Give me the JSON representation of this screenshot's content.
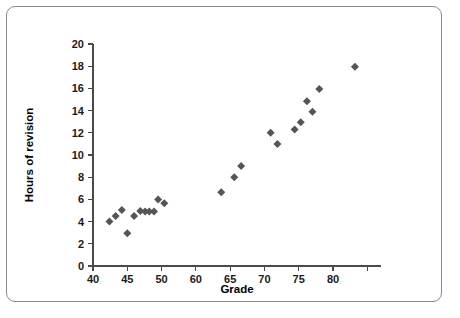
{
  "figure": {
    "border_color": "#8a8a8a",
    "background": "#ffffff"
  },
  "chart_data": {
    "type": "scatter",
    "title": "",
    "xlabel": "Grade",
    "ylabel": "Hours of revision",
    "xlim": [
      40,
      82
    ],
    "ylim": [
      0,
      20
    ],
    "grid": false,
    "legend": null,
    "marker": {
      "shape": "diamond",
      "color": "#555555",
      "size": 7
    },
    "x_ticks": [
      40,
      45,
      50,
      55,
      60,
      65,
      70,
      75,
      80
    ],
    "x_tick_labels": [
      "40",
      "45",
      "50",
      "60",
      "65",
      "70",
      "75",
      "80"
    ],
    "x_tick_label_values": [
      40,
      45,
      50,
      60,
      65,
      70,
      75,
      80
    ],
    "y_ticks": [
      0,
      2,
      4,
      6,
      8,
      10,
      12,
      14,
      16,
      18,
      20
    ],
    "y_tick_labels": [
      "0",
      "2",
      "4",
      "6",
      "8",
      "10",
      "12",
      "14",
      "16",
      "18",
      "20"
    ],
    "points": [
      {
        "x": 42.4,
        "y": 4.0
      },
      {
        "x": 43.3,
        "y": 4.5
      },
      {
        "x": 44.2,
        "y": 5.05
      },
      {
        "x": 45.0,
        "y": 2.95
      },
      {
        "x": 46.0,
        "y": 4.5
      },
      {
        "x": 46.9,
        "y": 4.95
      },
      {
        "x": 47.6,
        "y": 4.9
      },
      {
        "x": 48.2,
        "y": 4.9
      },
      {
        "x": 48.9,
        "y": 4.9
      },
      {
        "x": 49.5,
        "y": 6.0
      },
      {
        "x": 50.4,
        "y": 5.65
      },
      {
        "x": 58.7,
        "y": 6.65
      },
      {
        "x": 60.6,
        "y": 8.0
      },
      {
        "x": 61.6,
        "y": 9.0
      },
      {
        "x": 65.9,
        "y": 12.0
      },
      {
        "x": 66.9,
        "y": 11.0
      },
      {
        "x": 69.4,
        "y": 12.3
      },
      {
        "x": 70.3,
        "y": 12.95
      },
      {
        "x": 71.2,
        "y": 14.85
      },
      {
        "x": 72.0,
        "y": 13.9
      },
      {
        "x": 73.0,
        "y": 15.95
      },
      {
        "x": 78.2,
        "y": 17.95
      }
    ],
    "n_points": 22
  }
}
